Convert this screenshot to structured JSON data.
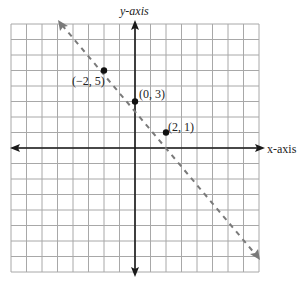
{
  "axes": {
    "x_label": "x-axis",
    "y_label": "y-axis",
    "x_range": [
      -8,
      8
    ],
    "y_range": [
      -8,
      8
    ]
  },
  "points": [
    {
      "x": -2,
      "y": 5,
      "label": "(−2, 5)"
    },
    {
      "x": 0,
      "y": 3,
      "label": "(0, 3)"
    },
    {
      "x": 2,
      "y": 1,
      "label": "(2, 1)"
    }
  ],
  "line": {
    "slope": -1,
    "intercept": 3,
    "style": "dashed",
    "color": "#7a7a7a"
  },
  "colors": {
    "grid": "#a8a8a8",
    "axis": "#1a1a1a",
    "point": "#111111"
  },
  "chart_data": {
    "type": "line",
    "title": "",
    "xlabel": "x-axis",
    "ylabel": "y-axis",
    "xlim": [
      -8,
      8
    ],
    "ylim": [
      -8,
      8
    ],
    "grid": true,
    "series": [
      {
        "name": "y = -x + 3",
        "style": "dashed",
        "x": [
          -5,
          11
        ],
        "y": [
          8,
          -8
        ]
      }
    ],
    "points": [
      {
        "x": -2,
        "y": 5,
        "label": "(−2, 5)"
      },
      {
        "x": 0,
        "y": 3,
        "label": "(0, 3)"
      },
      {
        "x": 2,
        "y": 1,
        "label": "(2, 1)"
      }
    ]
  }
}
